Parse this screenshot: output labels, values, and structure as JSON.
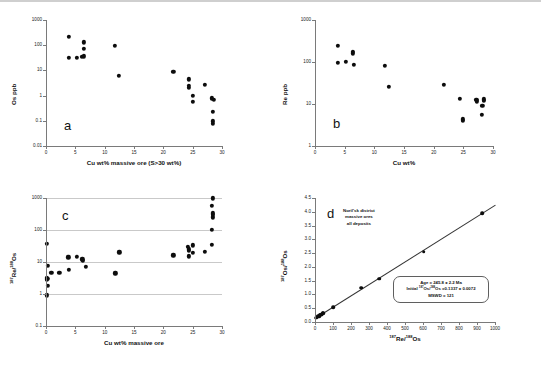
{
  "figure": {
    "panels": [
      {
        "id": "a",
        "label": "a",
        "x_title": "Cu wt% massive ore (S>30 wt%)",
        "y_title": "Os ppb",
        "x_ticks": [
          "0",
          "5",
          "10",
          "15",
          "20",
          "25",
          "30"
        ],
        "y_ticks": [
          "1000",
          "100",
          "10",
          "1",
          "0.1",
          "0.01"
        ]
      },
      {
        "id": "b",
        "label": "b",
        "x_title": "Cu wt%",
        "y_title": "Re ppb",
        "x_ticks": [
          "0",
          "5",
          "10",
          "15",
          "20",
          "25",
          "30"
        ],
        "y_ticks": [
          "1000",
          "100",
          "10",
          "1"
        ]
      },
      {
        "id": "c",
        "label": "c",
        "x_title": "Cu wt% massive ore",
        "y_title": "187Re/188Os",
        "x_ticks": [
          "0",
          "5",
          "10",
          "15",
          "20",
          "25",
          "30"
        ],
        "y_ticks": [
          "1000",
          "100",
          "10",
          "1",
          "0.1"
        ]
      },
      {
        "id": "d",
        "label": "d",
        "x_title": "187Re/188Os",
        "y_title": "187Os/188Os",
        "x_ticks": [
          "0",
          "100",
          "200",
          "300",
          "400",
          "500",
          "600",
          "700",
          "800",
          "900",
          "1000"
        ],
        "y_ticks": [
          "4.5",
          "4.0",
          "3.5",
          "3.0",
          "2.5",
          "2.0",
          "1.5",
          "1.0",
          "0.5",
          "0.0"
        ],
        "annotation": [
          "Noril'sk district",
          "massive ores",
          "all deposits"
        ],
        "results": {
          "age": "Age = 245.8 ± 2.2 Ma",
          "initial": "Initial 187Os/188Os =0.1337 ± 0.0072",
          "mswd": "MSWD = 121"
        }
      }
    ]
  },
  "chart_data": [
    {
      "type": "scatter",
      "panel": "a",
      "title": "",
      "xlabel": "Cu wt% massive ore (S>30 wt%)",
      "ylabel": "Os ppb",
      "xlim": [
        0,
        30
      ],
      "ylim": [
        0.01,
        1000
      ],
      "yscale": "log",
      "grid": false,
      "points": [
        {
          "x": 3.9,
          "y": 220
        },
        {
          "x": 3.9,
          "y": 32
        },
        {
          "x": 5.2,
          "y": 31
        },
        {
          "x": 6.1,
          "y": 35
        },
        {
          "x": 6.5,
          "y": 130
        },
        {
          "x": 6.5,
          "y": 70
        },
        {
          "x": 6.5,
          "y": 36
        },
        {
          "x": 11.7,
          "y": 92
        },
        {
          "x": 12.4,
          "y": 6.0
        },
        {
          "x": 21.7,
          "y": 8.5
        },
        {
          "x": 24.3,
          "y": 4.4
        },
        {
          "x": 24.3,
          "y": 2.4
        },
        {
          "x": 24.3,
          "y": 2.0
        },
        {
          "x": 25.0,
          "y": 1.0
        },
        {
          "x": 25.0,
          "y": 0.58
        },
        {
          "x": 27.1,
          "y": 2.6
        },
        {
          "x": 28.3,
          "y": 0.78
        },
        {
          "x": 28.6,
          "y": 0.66
        },
        {
          "x": 28.4,
          "y": 0.23
        },
        {
          "x": 28.4,
          "y": 0.095
        },
        {
          "x": 28.4,
          "y": 0.078
        }
      ]
    },
    {
      "type": "scatter",
      "panel": "b",
      "title": "",
      "xlabel": "Cu wt%",
      "ylabel": "Re ppb",
      "xlim": [
        0,
        30
      ],
      "ylim": [
        1,
        1000
      ],
      "yscale": "log",
      "grid": false,
      "points": [
        {
          "x": 3.9,
          "y": 245
        },
        {
          "x": 3.9,
          "y": 95
        },
        {
          "x": 5.2,
          "y": 100
        },
        {
          "x": 6.4,
          "y": 175
        },
        {
          "x": 6.4,
          "y": 160
        },
        {
          "x": 6.6,
          "y": 87
        },
        {
          "x": 11.8,
          "y": 80
        },
        {
          "x": 12.5,
          "y": 26
        },
        {
          "x": 21.7,
          "y": 29
        },
        {
          "x": 24.4,
          "y": 13.5
        },
        {
          "x": 24.9,
          "y": 4.3
        },
        {
          "x": 24.9,
          "y": 4.0
        },
        {
          "x": 27.2,
          "y": 12.5
        },
        {
          "x": 27.3,
          "y": 11.5
        },
        {
          "x": 28.2,
          "y": 9.2
        },
        {
          "x": 28.5,
          "y": 13.0
        },
        {
          "x": 28.5,
          "y": 12.0
        },
        {
          "x": 28.1,
          "y": 5.6
        }
      ]
    },
    {
      "type": "scatter",
      "panel": "c",
      "title": "",
      "xlabel": "Cu wt% massive ore",
      "ylabel": "187Re/188Os",
      "xlim": [
        0,
        30
      ],
      "ylim": [
        0.1,
        1000
      ],
      "yscale": "log",
      "grid": true,
      "points": [
        {
          "x": 0.15,
          "y": 37
        },
        {
          "x": 0.3,
          "y": 7.5
        },
        {
          "x": 0.2,
          "y": 3.2
        },
        {
          "x": 0.25,
          "y": 3.0
        },
        {
          "x": 0.2,
          "y": 2.8
        },
        {
          "x": 0.35,
          "y": 1.8
        },
        {
          "x": 0.1,
          "y": 0.9
        },
        {
          "x": 0.9,
          "y": 4.6
        },
        {
          "x": 2.3,
          "y": 4.5
        },
        {
          "x": 3.8,
          "y": 14
        },
        {
          "x": 3.9,
          "y": 5.6
        },
        {
          "x": 5.2,
          "y": 14.5
        },
        {
          "x": 6.2,
          "y": 12
        },
        {
          "x": 6.3,
          "y": 11
        },
        {
          "x": 6.8,
          "y": 7.2
        },
        {
          "x": 11.8,
          "y": 4.4
        },
        {
          "x": 12.5,
          "y": 20
        },
        {
          "x": 21.7,
          "y": 16
        },
        {
          "x": 24.2,
          "y": 30
        },
        {
          "x": 24.3,
          "y": 25
        },
        {
          "x": 24.3,
          "y": 22
        },
        {
          "x": 24.3,
          "y": 15
        },
        {
          "x": 25.0,
          "y": 33
        },
        {
          "x": 25.0,
          "y": 19
        },
        {
          "x": 27.1,
          "y": 21
        },
        {
          "x": 28.3,
          "y": 35
        },
        {
          "x": 28.3,
          "y": 100
        },
        {
          "x": 28.4,
          "y": 250
        },
        {
          "x": 28.4,
          "y": 300
        },
        {
          "x": 28.4,
          "y": 330
        },
        {
          "x": 28.3,
          "y": 560
        },
        {
          "x": 28.4,
          "y": 980
        }
      ]
    },
    {
      "type": "scatter",
      "panel": "d",
      "title": "Noril'sk district massive ores all deposits",
      "xlabel": "187Re/188Os",
      "ylabel": "187Os/188Os",
      "xlim": [
        0,
        1000
      ],
      "ylim": [
        0.0,
        4.5
      ],
      "yscale": "linear",
      "grid": false,
      "regression": {
        "slope": 0.004103,
        "intercept": 0.1337
      },
      "points": [
        {
          "x": 5,
          "y": 0.16
        },
        {
          "x": 10,
          "y": 0.17
        },
        {
          "x": 14,
          "y": 0.19
        },
        {
          "x": 18,
          "y": 0.2
        },
        {
          "x": 22,
          "y": 0.21
        },
        {
          "x": 26,
          "y": 0.24
        },
        {
          "x": 30,
          "y": 0.26
        },
        {
          "x": 34,
          "y": 0.27
        },
        {
          "x": 38,
          "y": 0.29
        },
        {
          "x": 42,
          "y": 0.31
        },
        {
          "x": 46,
          "y": 0.33
        },
        {
          "x": 102,
          "y": 0.54
        },
        {
          "x": 258,
          "y": 1.24
        },
        {
          "x": 358,
          "y": 1.57
        },
        {
          "x": 605,
          "y": 2.55
        },
        {
          "x": 930,
          "y": 3.95
        }
      ]
    }
  ]
}
